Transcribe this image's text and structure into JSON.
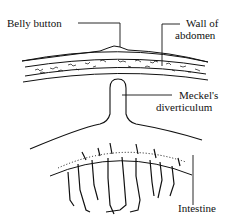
{
  "diagram": {
    "labels": {
      "belly_button": "Belly button",
      "wall_of_abdomen_line1": "Wall of",
      "wall_of_abdomen_line2": "abdomen",
      "meckels_line1": "Meckel's",
      "meckels_line2": "diverticulum",
      "intestine": "Intestine"
    },
    "colors": {
      "line": "#111111",
      "background": "#ffffff"
    }
  }
}
